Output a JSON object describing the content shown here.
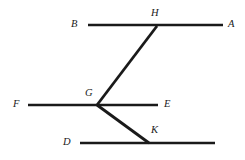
{
  "figure": {
    "background_color": "#ffffff",
    "stroke_color": "#1a1a1a",
    "label_color": "#1a1a1a",
    "width": 245,
    "height": 160
  },
  "labels": {
    "A": "A",
    "B": "B",
    "C": "C",
    "D": "D",
    "E": "E",
    "F": "F",
    "G": "G",
    "H": "H",
    "K": "K"
  },
  "chart_data": {
    "type": "diagram",
    "points": [
      {
        "name": "A",
        "x": 223,
        "y": 25,
        "label_x": 228,
        "label_y": 19
      },
      {
        "name": "B",
        "x": 88,
        "y": 25,
        "label_x": 71,
        "label_y": 19
      },
      {
        "name": "C",
        "x": 215,
        "y": 143,
        "label_x": 221,
        "label_y": 137
      },
      {
        "name": "D",
        "x": 80,
        "y": 143,
        "label_x": 63,
        "label_y": 137
      },
      {
        "name": "E",
        "x": 158,
        "y": 105,
        "label_x": 164,
        "label_y": 99
      },
      {
        "name": "F",
        "x": 28,
        "y": 105,
        "label_x": 13,
        "label_y": 99
      },
      {
        "name": "G",
        "x": 97,
        "y": 105,
        "label_x": 85,
        "label_y": 88
      },
      {
        "name": "H",
        "x": 157,
        "y": 26,
        "label_x": 151,
        "label_y": 8
      },
      {
        "name": "K",
        "x": 149,
        "y": 143,
        "label_x": 151,
        "label_y": 125
      }
    ],
    "segments": [
      {
        "name": "BA",
        "from": "B",
        "to": "A",
        "x1": 88,
        "y1": 25,
        "x2": 223,
        "y2": 25,
        "width": 2.4
      },
      {
        "name": "FE",
        "from": "F",
        "to": "E",
        "x1": 28,
        "y1": 105,
        "x2": 158,
        "y2": 105,
        "width": 2.4
      },
      {
        "name": "DC",
        "from": "D",
        "to": "C",
        "x1": 80,
        "y1": 143,
        "x2": 215,
        "y2": 143,
        "width": 2.4
      },
      {
        "name": "GH",
        "from": "G",
        "to": "H",
        "x1": 97,
        "y1": 105,
        "x2": 157,
        "y2": 26,
        "width": 2.8
      },
      {
        "name": "GK",
        "from": "G",
        "to": "K",
        "x1": 97,
        "y1": 105,
        "x2": 149,
        "y2": 143,
        "width": 2.8
      }
    ],
    "xlabel": "",
    "ylabel": "",
    "grid": false,
    "legend": false
  }
}
